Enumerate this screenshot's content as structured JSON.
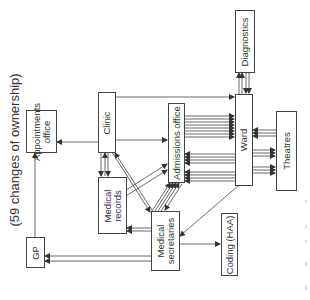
{
  "title": "(59 changes of ownership)",
  "nodes": {
    "appointments": {
      "label": "Appointments\noffice",
      "line1": "Appointments",
      "line2": "office"
    },
    "gp": {
      "label": "GP"
    },
    "clinic": {
      "label": "Clinic"
    },
    "medical_records": {
      "label": "Medical records",
      "line1": "Medical",
      "line2": "records"
    },
    "admissions": {
      "label": "Admissions office"
    },
    "medical_secretaries": {
      "label": "Medical secretaries",
      "line1": "Medical",
      "line2": "secretaries"
    },
    "coding": {
      "label": "Coding (HAA)"
    },
    "diagnostics": {
      "label": "Diagnostics"
    },
    "ward": {
      "label": "Ward"
    },
    "theatres": {
      "label": "Theatres"
    }
  },
  "edges": [
    {
      "from": "GP",
      "to": "Appointments office",
      "count": 1
    },
    {
      "from": "Clinic",
      "to": "Appointments office",
      "count": 1
    },
    {
      "from": "Clinic",
      "to": "Ward",
      "count": 1
    },
    {
      "from": "Clinic",
      "to": "Admissions office",
      "count": 1
    },
    {
      "from": "Clinic",
      "to": "Medical records",
      "count": 1
    },
    {
      "from": "Medical records",
      "to": "Clinic",
      "count": 1
    },
    {
      "from": "Clinic",
      "to": "Medical secretaries",
      "count": 1
    },
    {
      "from": "Medical secretaries",
      "to": "Clinic",
      "count": 1
    },
    {
      "from": "Medical records",
      "to": "Admissions office",
      "count": 2
    },
    {
      "from": "Medical secretaries",
      "to": "Admissions office",
      "count": 5
    },
    {
      "from": "Admissions office",
      "to": "Medical secretaries",
      "count": 1
    },
    {
      "from": "Medical secretaries",
      "to": "Medical records",
      "count": 2
    },
    {
      "from": "Medical secretaries",
      "to": "GP",
      "count": 2
    },
    {
      "from": "Admissions office",
      "to": "Ward",
      "count": 8
    },
    {
      "from": "Ward",
      "to": "Admissions office",
      "count": 8
    },
    {
      "from": "Ward",
      "to": "Diagnostics",
      "count": 2
    },
    {
      "from": "Diagnostics",
      "to": "Ward",
      "count": 2
    },
    {
      "from": "Theatres",
      "to": "Ward",
      "count": 3
    },
    {
      "from": "Ward",
      "to": "Theatres",
      "count": 6
    },
    {
      "from": "Ward",
      "to": "Medical secretaries",
      "count": 1
    },
    {
      "from": "Medical secretaries",
      "to": "Coding (HAA)",
      "count": 1
    }
  ]
}
